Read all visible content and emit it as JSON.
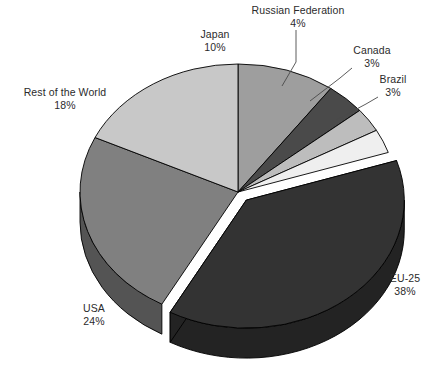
{
  "chart_data": {
    "type": "pie",
    "title": "",
    "subtitle": "",
    "xlabel": "",
    "ylabel": "",
    "legend_position": "none",
    "grid": false,
    "style": "3d-exploded-grayscale",
    "unit": "%",
    "categories": [
      "Japan",
      "Russian Federation",
      "Canada",
      "Brazil",
      "EU-25",
      "USA",
      "Rest of the World"
    ],
    "values": [
      10,
      4,
      3,
      3,
      38,
      24,
      18
    ],
    "slices": [
      {
        "key": "japan",
        "label": "Japan",
        "value": 10,
        "value_text": "10%",
        "color": "#9e9e9e",
        "side_color": "#6e6e6e",
        "exploded": false,
        "leader_line": false
      },
      {
        "key": "russian-federation",
        "label": "Russian Federation",
        "value": 4,
        "value_text": "4%",
        "color": "#4a4a4a",
        "side_color": "#343434",
        "exploded": false,
        "leader_line": true
      },
      {
        "key": "canada",
        "label": "Canada",
        "value": 3,
        "value_text": "3%",
        "color": "#bdbdbd",
        "side_color": "#8c8c8c",
        "exploded": false,
        "leader_line": true
      },
      {
        "key": "brazil",
        "label": "Brazil",
        "value": 3,
        "value_text": "3%",
        "color": "#efefef",
        "side_color": "#b5b5b5",
        "exploded": false,
        "leader_line": true
      },
      {
        "key": "eu-25",
        "label": "EU-25",
        "value": 38,
        "value_text": "38%",
        "color": "#333333",
        "side_color": "#232323",
        "exploded": true,
        "leader_line": false
      },
      {
        "key": "usa",
        "label": "USA",
        "value": 24,
        "value_text": "24%",
        "color": "#808080",
        "side_color": "#545454",
        "exploded": false,
        "leader_line": false
      },
      {
        "key": "rest-of-the-world",
        "label": "Rest of the World",
        "value": 18,
        "value_text": "18%",
        "color": "#c8c8c8",
        "side_color": "#949494",
        "exploded": false,
        "leader_line": false
      }
    ],
    "background_color": "#ffffff",
    "outline_color": "#000000"
  }
}
